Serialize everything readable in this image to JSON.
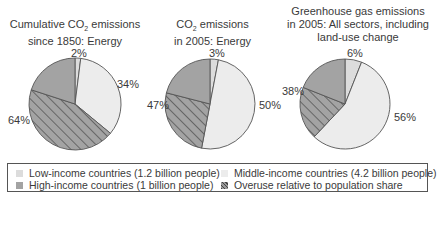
{
  "colors": {
    "low": "#dcdcdc",
    "middle": "#ececec",
    "high": "#a3a3a3",
    "overuse_fill": "#a3a3a3",
    "outline": "#555555"
  },
  "chart_data": [
    {
      "type": "pie",
      "title": "Cumulative CO2 emissions since 1850: Energy",
      "categories": [
        "Low-income countries",
        "Middle-income countries",
        "High-income countries"
      ],
      "values": [
        2,
        34,
        64
      ],
      "labels": [
        "2%",
        "34%",
        "64%"
      ],
      "overuse_share_of_high": 44
    },
    {
      "type": "pie",
      "title": "CO2 emissions in 2005: Energy",
      "categories": [
        "Low-income countries",
        "Middle-income countries",
        "High-income countries"
      ],
      "values": [
        3,
        50,
        47
      ],
      "labels": [
        "3%",
        "50%",
        "47%"
      ],
      "overuse_share_of_high": 26
    },
    {
      "type": "pie",
      "title": "Greenhouse gas emissions in 2005: All sectors, including land-use change",
      "categories": [
        "Low-income countries",
        "Middle-income countries",
        "High-income countries"
      ],
      "values": [
        6,
        56,
        38
      ],
      "labels": [
        "6%",
        "56%",
        "38%"
      ],
      "overuse_share_of_high": 19
    }
  ],
  "titles": {
    "pie1_line1": "Cumulative CO",
    "pie1_line1_sub": "2",
    "pie1_line1_end": " emissions",
    "pie1_line2": "since 1850: Energy",
    "pie2_line1": "CO",
    "pie2_line1_sub": "2",
    "pie2_line1_end": " emissions",
    "pie2_line2": "in 2005: Energy",
    "pie3_line1": "Greenhouse gas emissions",
    "pie3_line2": "in 2005: All sectors, including",
    "pie3_line3": "land-use change"
  },
  "labels": {
    "p1_low": "2%",
    "p1_mid": "34%",
    "p1_high": "64%",
    "p2_low": "3%",
    "p2_mid": "50%",
    "p2_high": "47%",
    "p3_low": "6%",
    "p3_mid": "56%",
    "p3_high": "38%"
  },
  "legend": {
    "low": "Low-income countries (1.2 billion people)",
    "middle": "Middle-income countries (4.2 billion people)",
    "high": "High-income countries (1 billion people)",
    "overuse": "Overuse relative to population share"
  }
}
